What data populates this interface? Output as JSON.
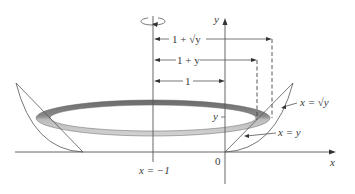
{
  "diagram": {
    "axes": {
      "x_label": "x",
      "y_label": "y",
      "origin_label": "0"
    },
    "rotation_axis": {
      "label": "x = −1"
    },
    "curves": {
      "outer": "x = √y",
      "inner": "x = y"
    },
    "dimensions": {
      "outer_radius": "1 + √y",
      "inner_radius": "1 + y",
      "axis_distance": "1"
    },
    "height_marker": "y",
    "colors": {
      "ring_dark": "#6f6f6f",
      "ring_light": "#c9c9c9",
      "lines": "#555555"
    }
  }
}
